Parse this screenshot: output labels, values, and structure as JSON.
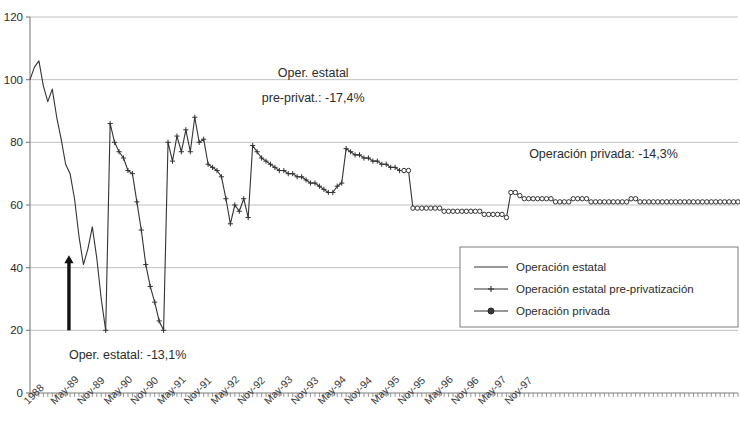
{
  "chart_data": {
    "type": "line",
    "title": "",
    "xlabel": "",
    "ylabel": "",
    "ylim": [
      0,
      120
    ],
    "yticks": [
      0,
      20,
      40,
      60,
      80,
      100,
      120
    ],
    "grid": true,
    "legend_position": "inside-bottom-right",
    "xtick_labels": [
      "1988",
      "May-89",
      "Nov-89",
      "May-90",
      "Nov-90",
      "May-91",
      "Nov-91",
      "May-92",
      "Nov-92",
      "May-93",
      "Nov-93",
      "May-94",
      "Nov-94",
      "May-95",
      "Nov-95",
      "May-96",
      "Nov-96",
      "May-97",
      "Nov-97"
    ],
    "x_tick_interval_months": 6,
    "x_start": "1988-11",
    "x_end": "1997-12",
    "series": [
      {
        "name": "Operación estatal",
        "marker": "none",
        "color": "#333333",
        "values": [
          100,
          104,
          106,
          98,
          93,
          97,
          88,
          81,
          73,
          70,
          62,
          50,
          41,
          46,
          53,
          43,
          30,
          20
        ]
      },
      {
        "name": "Operación estatal pre-privatización",
        "marker": "cross",
        "color": "#333333",
        "values": [
          20,
          86,
          80,
          77,
          75,
          71,
          70,
          61,
          52,
          41,
          34,
          29,
          23,
          20,
          80,
          74,
          82,
          77,
          84,
          77,
          88,
          80,
          81,
          73,
          72,
          71,
          69,
          62,
          54,
          60,
          58,
          62,
          56,
          79,
          77,
          75,
          74,
          73,
          72,
          71,
          71,
          70,
          70,
          69,
          69,
          68,
          67,
          67,
          66,
          65,
          64,
          64,
          66,
          67,
          78,
          77,
          76,
          76,
          75,
          75,
          74,
          74,
          73,
          73,
          72,
          72,
          71,
          71
        ]
      },
      {
        "name": "Operación privada",
        "marker": "circle",
        "color": "#333333",
        "values": [
          71,
          71,
          59,
          59,
          59,
          59,
          59,
          59,
          59,
          58,
          58,
          58,
          58,
          58,
          58,
          58,
          58,
          58,
          57,
          57,
          57,
          57,
          57,
          56,
          64,
          64,
          63,
          62,
          62,
          62,
          62,
          62,
          62,
          62,
          61,
          61,
          61,
          61,
          62,
          62,
          62,
          62,
          61,
          61,
          61,
          61,
          61,
          61,
          61,
          61,
          61,
          62,
          62,
          61,
          61,
          61,
          61,
          61,
          61,
          61,
          61,
          61,
          61,
          61,
          61,
          61,
          61,
          61,
          61,
          61,
          61,
          61,
          61,
          61,
          61,
          61
        ]
      }
    ],
    "annotations": [
      {
        "id": "annot-estatal",
        "text": "Oper. estatal: -13,1%",
        "x_pct": 0.055,
        "y_value": 11
      },
      {
        "id": "annot-pre-privat-line1",
        "text": "Oper. estatal",
        "x_pct": 0.4,
        "y_value": 101
      },
      {
        "id": "annot-pre-privat-line2",
        "text": "pre-privat.: -17,4%",
        "x_pct": 0.4,
        "y_value": 93
      },
      {
        "id": "annot-privada",
        "text": "Operación privada: -14,3%",
        "x_pct": 0.81,
        "y_value": 75
      }
    ],
    "arrow": {
      "id": "arrow-estatal",
      "x_pct": 0.055,
      "y_from": 20,
      "y_to": 44
    }
  },
  "legend": {
    "items": [
      {
        "label": "Operación estatal",
        "marker": "none"
      },
      {
        "label": "Operación estatal pre-privatización",
        "marker": "cross"
      },
      {
        "label": "Operación privada",
        "marker": "circle"
      }
    ]
  },
  "axis": {
    "y_labels": [
      "120",
      "100",
      "80",
      "60",
      "40",
      "20",
      "0"
    ]
  }
}
